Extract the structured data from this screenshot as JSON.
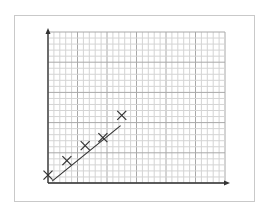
{
  "chart_data": {
    "type": "scatter",
    "title": "",
    "xlabel": "",
    "ylabel": "",
    "grid": true,
    "grid_units": "cells",
    "xlim": [
      0,
      30
    ],
    "ylim": [
      0,
      25
    ],
    "legend": null,
    "series": [
      {
        "name": "data points",
        "marker": "x",
        "x": [
          0,
          3.2,
          6.3,
          9.3,
          12.5
        ],
        "y": [
          1.3,
          3.7,
          6.2,
          7.5,
          11.2
        ]
      }
    ],
    "fit_line": {
      "name": "line of best fit",
      "x": [
        0.7,
        12.3
      ],
      "y": [
        0.3,
        9.5
      ]
    },
    "colors": {
      "grid_minor": "#d4d4d4",
      "grid_major": "#a8a8a8",
      "axis": "#333333",
      "marker": "#333333",
      "frame": "#c9c9c9"
    }
  }
}
